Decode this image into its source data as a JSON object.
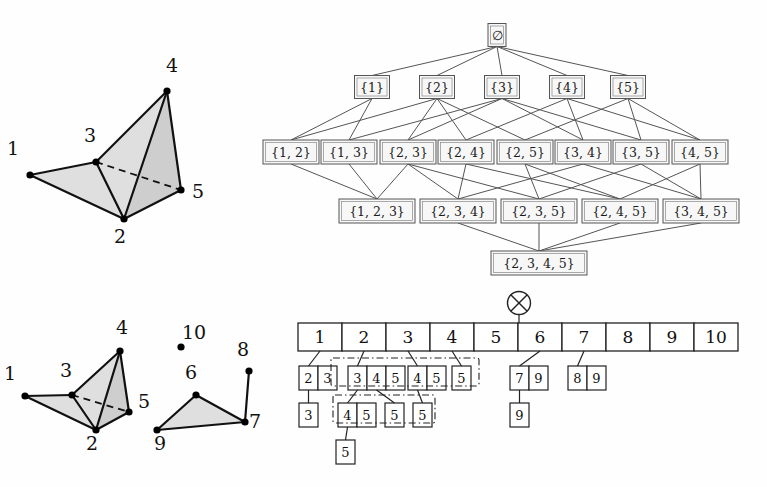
{
  "figure": {
    "width": 767,
    "height": 487,
    "background": "#fefefe",
    "ink": "#111111",
    "face_fill": "#d9d9d9",
    "box_fill": "#f7f7f7",
    "box_stroke": "#555555"
  },
  "panels": {
    "top_left": {
      "name": "simplicial-complex-top",
      "vertex_labels": [
        "1",
        "2",
        "3",
        "4",
        "5"
      ],
      "vertices": [
        {
          "id": "1",
          "label": "1",
          "x": 30,
          "y": 175,
          "label_x": 13,
          "label_y": 155
        },
        {
          "id": "2",
          "label": "2",
          "x": 124,
          "y": 219,
          "label_x": 120,
          "label_y": 243
        },
        {
          "id": "3",
          "label": "3",
          "x": 96,
          "y": 162,
          "label_x": 90,
          "label_y": 142
        },
        {
          "id": "4",
          "label": "4",
          "x": 167,
          "y": 91,
          "label_x": 172,
          "label_y": 72
        },
        {
          "id": "5",
          "label": "5",
          "x": 181,
          "y": 190,
          "label_x": 198,
          "label_y": 198
        }
      ],
      "solid_edges": [
        [
          "1",
          "3"
        ],
        [
          "1",
          "2"
        ],
        [
          "3",
          "2"
        ],
        [
          "3",
          "4"
        ],
        [
          "4",
          "2"
        ],
        [
          "4",
          "5"
        ],
        [
          "2",
          "5"
        ]
      ],
      "dashed_edges": [
        [
          "3",
          "5"
        ]
      ],
      "shaded_faces": [
        [
          "1",
          "3",
          "2"
        ],
        [
          "3",
          "4",
          "2"
        ],
        [
          "4",
          "2",
          "5"
        ]
      ]
    },
    "top_right": {
      "name": "face-lattice",
      "levels": [
        {
          "level": 0,
          "nodes": [
            {
              "label": "∅",
              "x": 497,
              "y": 35,
              "w": 18,
              "h": 23
            }
          ]
        },
        {
          "level": 1,
          "nodes": [
            {
              "label": "{1}",
              "x": 372,
              "y": 87,
              "w": 35,
              "h": 23
            },
            {
              "label": "{2}",
              "x": 437,
              "y": 87,
              "w": 35,
              "h": 23
            },
            {
              "label": "{3}",
              "x": 502,
              "y": 87,
              "w": 35,
              "h": 23
            },
            {
              "label": "{4}",
              "x": 567,
              "y": 87,
              "w": 35,
              "h": 23
            },
            {
              "label": "{5}",
              "x": 628,
              "y": 87,
              "w": 35,
              "h": 23
            }
          ]
        },
        {
          "level": 2,
          "nodes": [
            {
              "label": "{1, 2}",
              "x": 291,
              "y": 152,
              "w": 56,
              "h": 24
            },
            {
              "label": "{1, 3}",
              "x": 349,
              "y": 152,
              "w": 56,
              "h": 24
            },
            {
              "label": "{2, 3}",
              "x": 408,
              "y": 152,
              "w": 56,
              "h": 24
            },
            {
              "label": "{2, 4}",
              "x": 466,
              "y": 152,
              "w": 56,
              "h": 24
            },
            {
              "label": "{2, 5}",
              "x": 525,
              "y": 152,
              "w": 56,
              "h": 24
            },
            {
              "label": "{3, 4}",
              "x": 583,
              "y": 152,
              "w": 56,
              "h": 24
            },
            {
              "label": "{3, 5}",
              "x": 641,
              "y": 152,
              "w": 56,
              "h": 24
            },
            {
              "label": "{4, 5}",
              "x": 700,
              "y": 152,
              "w": 56,
              "h": 24
            }
          ]
        },
        {
          "level": 3,
          "nodes": [
            {
              "label": "{1, 2, 3}",
              "x": 377,
              "y": 211,
              "w": 76,
              "h": 24
            },
            {
              "label": "{2, 3, 4}",
              "x": 458,
              "y": 211,
              "w": 76,
              "h": 24
            },
            {
              "label": "{2, 3, 5}",
              "x": 539,
              "y": 211,
              "w": 76,
              "h": 24
            },
            {
              "label": "{2, 4, 5}",
              "x": 620,
              "y": 211,
              "w": 76,
              "h": 24
            },
            {
              "label": "{3, 4, 5}",
              "x": 701,
              "y": 211,
              "w": 76,
              "h": 24
            }
          ]
        },
        {
          "level": 4,
          "nodes": [
            {
              "label": "{2, 3, 4, 5}",
              "x": 539,
              "y": 263,
              "w": 96,
              "h": 24
            }
          ]
        }
      ],
      "edges": [
        [
          "∅",
          "{1}"
        ],
        [
          "∅",
          "{2}"
        ],
        [
          "∅",
          "{3}"
        ],
        [
          "∅",
          "{4}"
        ],
        [
          "∅",
          "{5}"
        ],
        [
          "{1}",
          "{1, 2}"
        ],
        [
          "{1}",
          "{1, 3}"
        ],
        [
          "{2}",
          "{1, 2}"
        ],
        [
          "{2}",
          "{2, 3}"
        ],
        [
          "{2}",
          "{2, 4}"
        ],
        [
          "{2}",
          "{2, 5}"
        ],
        [
          "{3}",
          "{1, 3}"
        ],
        [
          "{3}",
          "{2, 3}"
        ],
        [
          "{3}",
          "{3, 4}"
        ],
        [
          "{3}",
          "{3, 5}"
        ],
        [
          "{4}",
          "{2, 4}"
        ],
        [
          "{4}",
          "{3, 4}"
        ],
        [
          "{4}",
          "{4, 5}"
        ],
        [
          "{5}",
          "{2, 5}"
        ],
        [
          "{5}",
          "{3, 5}"
        ],
        [
          "{5}",
          "{4, 5}"
        ],
        [
          "{1, 2}",
          "{1, 2, 3}"
        ],
        [
          "{1, 3}",
          "{1, 2, 3}"
        ],
        [
          "{2, 3}",
          "{1, 2, 3}"
        ],
        [
          "{2, 3}",
          "{2, 3, 4}"
        ],
        [
          "{2, 3}",
          "{2, 3, 5}"
        ],
        [
          "{2, 4}",
          "{2, 3, 4}"
        ],
        [
          "{2, 4}",
          "{2, 4, 5}"
        ],
        [
          "{2, 5}",
          "{2, 3, 5}"
        ],
        [
          "{2, 5}",
          "{2, 4, 5}"
        ],
        [
          "{3, 4}",
          "{2, 3, 4}"
        ],
        [
          "{3, 4}",
          "{3, 4, 5}"
        ],
        [
          "{3, 5}",
          "{2, 3, 5}"
        ],
        [
          "{3, 5}",
          "{3, 4, 5}"
        ],
        [
          "{4, 5}",
          "{2, 4, 5}"
        ],
        [
          "{4, 5}",
          "{3, 4, 5}"
        ],
        [
          "{2, 3, 4}",
          "{2, 3, 4, 5}"
        ],
        [
          "{2, 3, 5}",
          "{2, 3, 4, 5}"
        ],
        [
          "{2, 4, 5}",
          "{2, 3, 4, 5}"
        ],
        [
          "{3, 4, 5}",
          "{2, 3, 4, 5}"
        ]
      ]
    },
    "bottom_left": {
      "name": "simplicial-complex-bottom",
      "vertex_labels": [
        "1",
        "2",
        "3",
        "4",
        "5",
        "6",
        "7",
        "8",
        "9",
        "10"
      ],
      "vertices": [
        {
          "id": "1",
          "label": "1",
          "x": 25,
          "y": 396,
          "label_x": 10,
          "label_y": 380
        },
        {
          "id": "2",
          "label": "2",
          "x": 96,
          "y": 430,
          "label_x": 92,
          "label_y": 450
        },
        {
          "id": "3",
          "label": "3",
          "x": 72,
          "y": 395,
          "label_x": 66,
          "label_y": 377
        },
        {
          "id": "4",
          "label": "4",
          "x": 120,
          "y": 351,
          "label_x": 122,
          "label_y": 334
        },
        {
          "id": "5",
          "label": "5",
          "x": 129,
          "y": 412,
          "label_x": 144,
          "label_y": 408
        },
        {
          "id": "6",
          "label": "6",
          "x": 196,
          "y": 395,
          "label_x": 191,
          "label_y": 379
        },
        {
          "id": "7",
          "label": "7",
          "x": 245,
          "y": 422,
          "label_x": 255,
          "label_y": 428
        },
        {
          "id": "8",
          "label": "8",
          "x": 249,
          "y": 371,
          "label_x": 243,
          "label_y": 356
        },
        {
          "id": "9",
          "label": "9",
          "x": 157,
          "y": 430,
          "label_x": 160,
          "label_y": 450
        },
        {
          "id": "10",
          "label": "10",
          "x": 181,
          "y": 347,
          "label_x": 194,
          "label_y": 339
        }
      ],
      "solid_edges": [
        [
          "1",
          "3"
        ],
        [
          "1",
          "2"
        ],
        [
          "3",
          "2"
        ],
        [
          "3",
          "4"
        ],
        [
          "4",
          "2"
        ],
        [
          "4",
          "5"
        ],
        [
          "2",
          "5"
        ],
        [
          "6",
          "9"
        ],
        [
          "6",
          "7"
        ],
        [
          "9",
          "7"
        ],
        [
          "7",
          "8"
        ]
      ],
      "dashed_edges": [
        [
          "3",
          "5"
        ]
      ],
      "shaded_faces": [
        [
          "1",
          "3",
          "2"
        ],
        [
          "3",
          "4",
          "2"
        ],
        [
          "4",
          "2",
          "5"
        ],
        [
          "6",
          "9",
          "7"
        ]
      ],
      "isolated_vertices": [
        "10"
      ]
    },
    "bottom_right": {
      "name": "bucket-array-tree",
      "root_icon": "circled-x-icon",
      "root_icon_x": 519,
      "root_icon_y": 303,
      "array": {
        "x": 298,
        "y": 323,
        "cell_w": 44,
        "cell_h": 28,
        "cells": [
          "1",
          "2",
          "3",
          "4",
          "5",
          "6",
          "7",
          "8",
          "9",
          "10"
        ]
      },
      "tree_rows": [
        {
          "row": 1,
          "y": 366,
          "groups": [
            {
              "name": "group-23",
              "x": 299,
              "cells": [
                "2",
                "3"
              ],
              "parent_cell": 0
            },
            {
              "name": "group-345",
              "x": 348,
              "cells": [
                "3",
                "4",
                "5"
              ],
              "parent_cell": 1
            },
            {
              "name": "group-45",
              "x": 408,
              "cells": [
                "4",
                "5"
              ],
              "parent_cell": 2
            },
            {
              "name": "group-5",
              "x": 452,
              "cells": [
                "5"
              ],
              "parent_cell": 3
            },
            {
              "name": "group-79",
              "x": 510,
              "cells": [
                "7",
                "9"
              ],
              "parent_cell": 5
            },
            {
              "name": "group-89",
              "x": 568,
              "cells": [
                "8",
                "9"
              ],
              "parent_cell": 6
            }
          ]
        },
        {
          "row": 2,
          "y": 403,
          "groups": [
            {
              "name": "group-3",
              "x": 299,
              "cells": [
                "3"
              ]
            },
            {
              "name": "group-45b",
              "x": 338,
              "cells": [
                "4",
                "5"
              ]
            },
            {
              "name": "group-5b",
              "x": 385,
              "cells": [
                "5"
              ]
            },
            {
              "name": "group-5c",
              "x": 413,
              "cells": [
                "5"
              ]
            },
            {
              "name": "group-9",
              "x": 510,
              "cells": [
                "9"
              ]
            }
          ]
        },
        {
          "row": 3,
          "y": 440,
          "groups": [
            {
              "name": "group-5d",
              "x": 336,
              "cells": [
                "5"
              ]
            }
          ]
        }
      ],
      "dashdot_boxes": [
        {
          "name": "dashdot-row1",
          "x": 331,
          "y": 358,
          "w": 148,
          "h": 28
        },
        {
          "name": "dashdot-row2",
          "x": 333,
          "y": 395,
          "w": 102,
          "h": 28
        }
      ]
    }
  }
}
